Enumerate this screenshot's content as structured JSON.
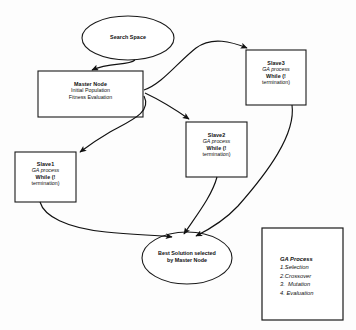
{
  "diagram": {
    "background_color": "#fdfdfd",
    "stroke_color": "#111111",
    "nodes": {
      "search_space": {
        "shape": "ellipse",
        "label": "Search Space"
      },
      "master_node": {
        "shape": "rectangle",
        "title": "Master Node",
        "line2": "Initial Population",
        "line3": "Fitness Evaluation"
      },
      "slave1": {
        "shape": "rectangle",
        "title": "Slave1",
        "line2": "GA process",
        "line3": "While (!",
        "line4": "termination)"
      },
      "slave2": {
        "shape": "rectangle",
        "title": "Slave2",
        "line2": "GA process",
        "line3": "While (!",
        "line4": "termination)"
      },
      "slave3": {
        "shape": "rectangle",
        "title": "Slave3",
        "line2": "GA process",
        "line3": "While (!",
        "line4": "termination)"
      },
      "best_solution": {
        "shape": "ellipse",
        "line1": "Best Solution selected",
        "line2": "by Master Node"
      }
    },
    "legend": {
      "heading": "GA Process",
      "items": [
        "1.Selection",
        "2.Crossover",
        "3.  Mutation",
        "4. Evaluation"
      ]
    },
    "edges": [
      {
        "name": "search-space-to-master",
        "from": "search_space",
        "to": "master_node",
        "arrow": true
      },
      {
        "name": "master-to-slave1",
        "from": "master_node",
        "to": "slave1",
        "arrow": true
      },
      {
        "name": "master-to-slave2",
        "from": "master_node",
        "to": "slave2",
        "arrow": true
      },
      {
        "name": "master-to-slave3",
        "from": "master_node",
        "to": "slave3",
        "arrow": true
      },
      {
        "name": "slave1-to-best-solution",
        "from": "slave1",
        "to": "best_solution",
        "arrow": true
      },
      {
        "name": "slave2-to-best-solution",
        "from": "slave2",
        "to": "best_solution",
        "arrow": true
      },
      {
        "name": "slave3-to-best-solution",
        "from": "slave3",
        "to": "best_solution",
        "arrow": true
      }
    ]
  }
}
